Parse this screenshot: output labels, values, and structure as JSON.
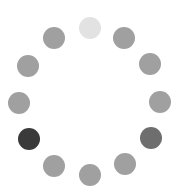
{
  "spinner": {
    "label": "loading-spinner",
    "dot_diameter": 22,
    "dots": [
      {
        "x": 90,
        "y": 28,
        "color": "#e2e2e2"
      },
      {
        "x": 124,
        "y": 38,
        "color": "#a0a0a0"
      },
      {
        "x": 150,
        "y": 64,
        "color": "#a0a0a0"
      },
      {
        "x": 160,
        "y": 102,
        "color": "#a0a0a0"
      },
      {
        "x": 151,
        "y": 138,
        "color": "#6e6e6e"
      },
      {
        "x": 125,
        "y": 164,
        "color": "#a0a0a0"
      },
      {
        "x": 90,
        "y": 175,
        "color": "#a0a0a0"
      },
      {
        "x": 54,
        "y": 166,
        "color": "#a0a0a0"
      },
      {
        "x": 29,
        "y": 139,
        "color": "#3a3a3a"
      },
      {
        "x": 19,
        "y": 103,
        "color": "#a0a0a0"
      },
      {
        "x": 28,
        "y": 66,
        "color": "#a0a0a0"
      },
      {
        "x": 54,
        "y": 38,
        "color": "#a0a0a0"
      }
    ]
  }
}
